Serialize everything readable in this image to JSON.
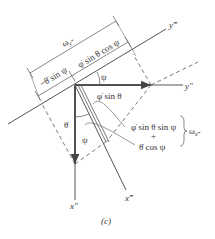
{
  "figure": {
    "caption": "(c)",
    "axes": {
      "y_triple_prime": "y‴",
      "y_double_prime": "y″",
      "x_double_prime": "x″",
      "x_triple_prime": "x‴"
    },
    "labels": {
      "omega_y": "ω",
      "omega_y_sub": "y‴",
      "phi_dot_sin_theta_cos_psi": "φ̇ sin θ cos ψ",
      "minus_theta_dot_sin_psi": "−θ̇ sin ψ",
      "psi_top": "ψ",
      "phi_dot_sin_theta": "φ̇ sin θ",
      "theta_dot": "θ̇",
      "psi_bottom": "ψ",
      "phi_dot_sin_theta_sin_psi": "φ̇ sin θ sin ψ",
      "plus": "+",
      "theta_dot_cos_psi": "θ̇ cos ψ",
      "omega_x": "ω",
      "omega_x_sub": "x‴"
    },
    "colors": {
      "line": "#555555",
      "text": "#333333",
      "background": "#ffffff"
    }
  }
}
